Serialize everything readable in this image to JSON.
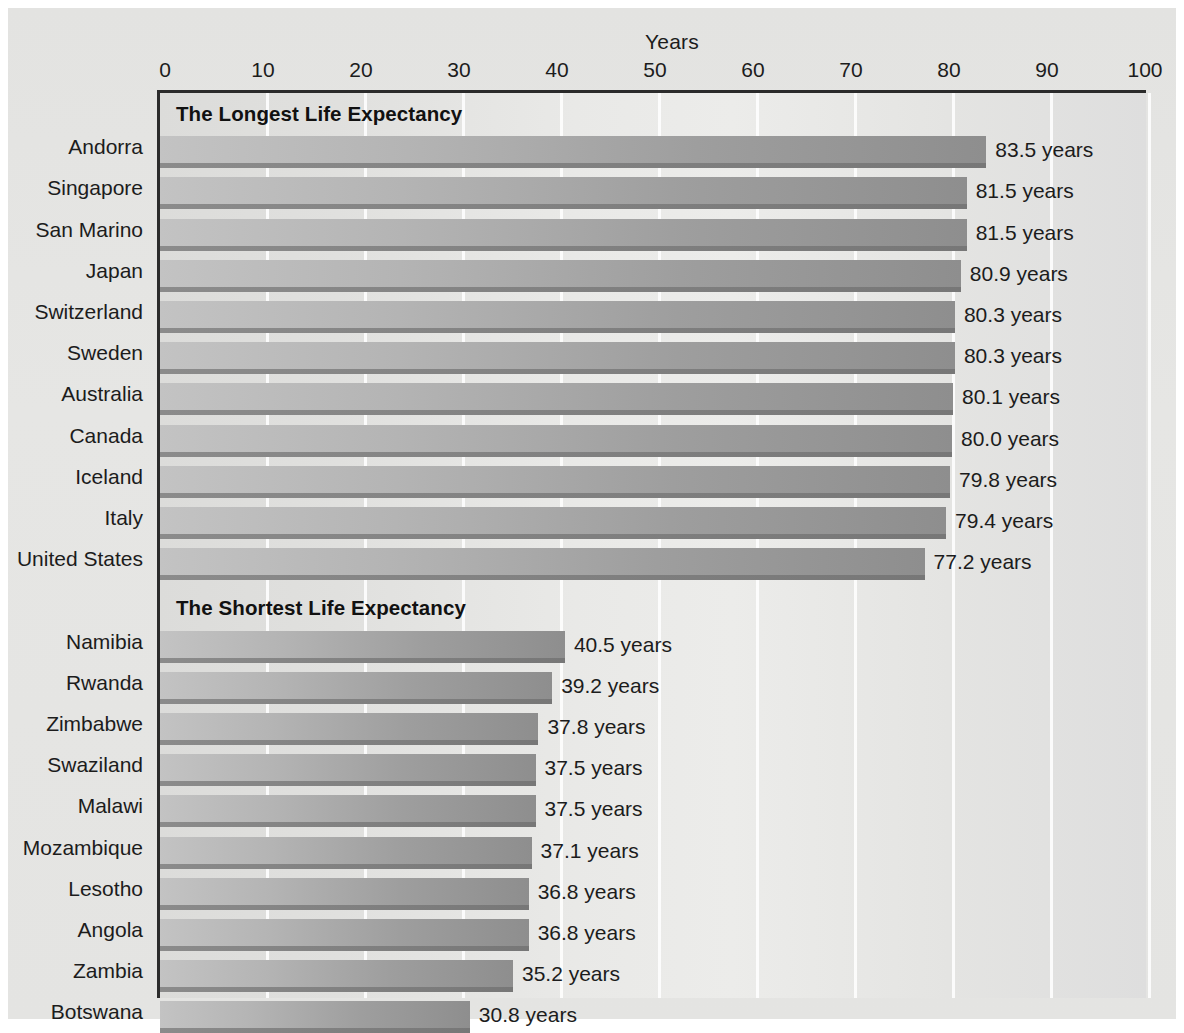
{
  "chart_data": {
    "type": "bar",
    "orientation": "horizontal",
    "title": "",
    "xlabel": "Years",
    "ylabel": "",
    "xlim": [
      0,
      100
    ],
    "xticks": [
      0,
      10,
      20,
      30,
      40,
      50,
      60,
      70,
      80,
      90,
      100
    ],
    "xtick_labels": [
      "0",
      "10",
      "20",
      "30",
      "40",
      "50",
      "60",
      "70",
      "80",
      "90",
      "100"
    ],
    "grid": true,
    "legend": "none",
    "value_suffix": "years",
    "sections": [
      {
        "title": "The Longest Life Expectancy",
        "categories": [
          "Andorra",
          "Singapore",
          "San Marino",
          "Japan",
          "Switzerland",
          "Sweden",
          "Australia",
          "Canada",
          "Iceland",
          "Italy",
          "United States"
        ],
        "values": [
          83.5,
          81.5,
          81.5,
          80.9,
          80.3,
          80.3,
          80.1,
          80.0,
          79.8,
          79.4,
          77.2
        ],
        "value_labels": [
          "83.5 years",
          "81.5 years",
          "81.5 years",
          "80.9 years",
          "80.3 years",
          "80.3 years",
          "80.1 years",
          "80.0 years",
          "79.8 years",
          "79.4 years",
          "77.2 years"
        ]
      },
      {
        "title": "The Shortest Life Expectancy",
        "categories": [
          "Namibia",
          "Rwanda",
          "Zimbabwe",
          "Swaziland",
          "Malawi",
          "Mozambique",
          "Lesotho",
          "Angola",
          "Zambia",
          "Botswana"
        ],
        "values": [
          40.5,
          39.2,
          37.8,
          37.5,
          37.5,
          37.1,
          36.8,
          36.8,
          35.2,
          30.8
        ],
        "value_labels": [
          "40.5 years",
          "39.2 years",
          "37.8 years",
          "37.5 years",
          "37.5 years",
          "37.1 years",
          "36.8 years",
          "36.8 years",
          "35.2 years",
          "30.8 years"
        ]
      }
    ]
  },
  "colors": {
    "page_background": "#e5e5e3",
    "plot_background": "#e7e7e5",
    "gridline": "#fdfdfd",
    "axis_line": "#2b2b2b",
    "bar_light": "#c3c3c3",
    "bar_dark": "#8e8e8e",
    "bar_underline": "#818181",
    "text": "#1c1c1c",
    "section_title_text": "#111111"
  }
}
